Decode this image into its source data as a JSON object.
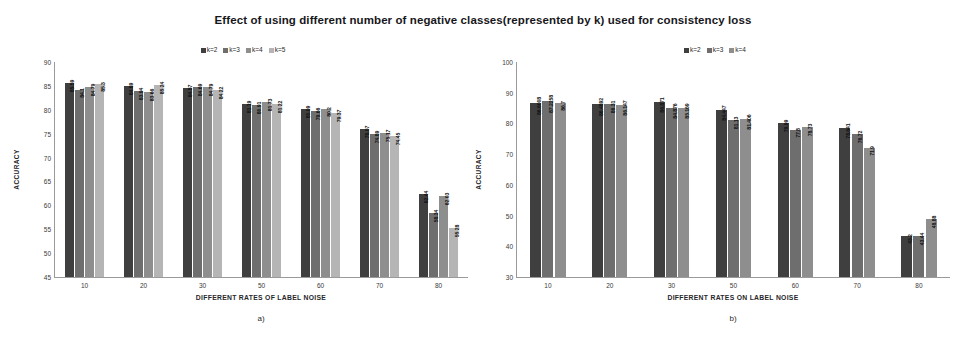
{
  "figure": {
    "suptitle": "Effect of  using different number of negative classes(represented by k) used for consistency loss",
    "background": "#ffffff"
  },
  "series_colors": {
    "k2": "#3f3f3f",
    "k3": "#6e6e6e",
    "k4": "#8e8e8e",
    "k5": "#b5b5b5"
  },
  "chart_data": [
    {
      "id": "a",
      "type": "bar",
      "title": "",
      "caption": "a)",
      "xlabel": "DIFFERENT RATES OF LABEL NOISE",
      "ylabel": "ACCURACY",
      "categories": [
        "10",
        "20",
        "30",
        "50",
        "60",
        "70",
        "80"
      ],
      "ylim": [
        45,
        90
      ],
      "yticks": [
        90,
        85,
        80,
        75,
        70,
        65,
        60,
        55,
        50,
        45
      ],
      "grid": false,
      "legend_position": "top-center",
      "series": [
        {
          "name": "k=2",
          "color": "#3f3f3f",
          "values": [
            85.59,
            84.89,
            84.57,
            81.19,
            80.09,
            76.07,
            62.44
          ]
        },
        {
          "name": "k=3",
          "color": "#6e6e6e",
          "values": [
            84.1,
            83.94,
            84.69,
            80.91,
            79.66,
            74.89,
            58.34
          ]
        },
        {
          "name": "k=4",
          "color": "#8e8e8e",
          "values": [
            84.79,
            83.66,
            84.79,
            81.73,
            80.2,
            75.17,
            62.03
          ]
        },
        {
          "name": "k=5",
          "color": "#b5b5b5",
          "values": [
            85.3,
            85.24,
            84.22,
            81.22,
            79.37,
            74.45,
            55.28
          ]
        }
      ]
    },
    {
      "id": "b",
      "type": "bar",
      "title": "",
      "caption": "b)",
      "xlabel": "DIFFERENT RATES ON LABEL NOISE",
      "ylabel": "ACCURACY",
      "categories": [
        "10",
        "20",
        "30",
        "50",
        "60",
        "70",
        "80"
      ],
      "ylim": [
        30,
        100
      ],
      "yticks": [
        100,
        90,
        80,
        70,
        60,
        50,
        40,
        30
      ],
      "grid": false,
      "legend_position": "top-center",
      "series": [
        {
          "name": "k=2",
          "color": "#3f3f3f",
          "values": [
            86.6008,
            86.4892,
            86.871,
            84.447,
            79.99,
            78.641
          ]
        },
        {
          "name": "k=3",
          "color": "#6e6e6e",
          "values": [
            87.2258,
            86.31,
            84.876,
            81.13,
            77.8,
            76.72
          ]
        },
        {
          "name": "k=4",
          "color": "#8e8e8e",
          "values": [
            86.7,
            86.147,
            85.169,
            81.406,
            78.73,
            71.9
          ]
        }
      ],
      "series_full": [
        {
          "name": "k=2",
          "color": "#3f3f3f",
          "values": [
            86.6008,
            86.4892,
            86.871,
            84.447,
            79.99,
            78.641,
            43.2
          ]
        },
        {
          "name": "k=3",
          "color": "#6e6e6e",
          "values": [
            87.2258,
            86.31,
            84.876,
            81.13,
            77.8,
            76.72,
            43.44
          ]
        },
        {
          "name": "k=4",
          "color": "#8e8e8e",
          "values": [
            86.7,
            86.147,
            85.169,
            81.406,
            78.73,
            71.9,
            48.88
          ]
        }
      ]
    }
  ]
}
